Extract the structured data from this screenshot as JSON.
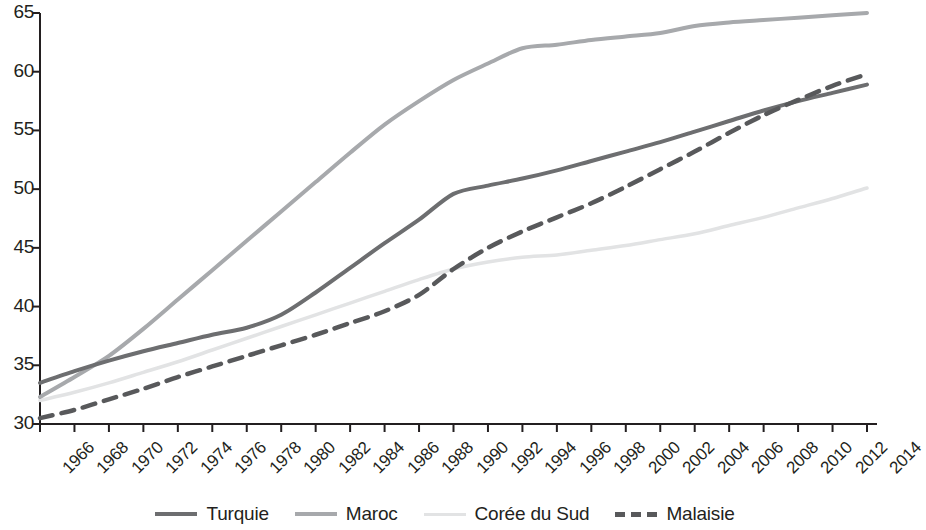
{
  "chart_data": {
    "type": "line",
    "title": "",
    "xlabel": "",
    "ylabel": "",
    "xlim": [
      1966,
      2014
    ],
    "ylim": [
      30,
      65
    ],
    "grid": false,
    "legend_position": "bottom",
    "x_ticks": [
      "1966",
      "1968",
      "1970",
      "1972",
      "1974",
      "1976",
      "1978",
      "1980",
      "1982",
      "1984",
      "1986",
      "1988",
      "1990",
      "1992",
      "1994",
      "1996",
      "1998",
      "2000",
      "2002",
      "2004",
      "2006",
      "2008",
      "2010",
      "2012",
      "2014"
    ],
    "y_ticks": [
      "30",
      "35",
      "40",
      "45",
      "50",
      "55",
      "60",
      "65"
    ],
    "x": [
      1966,
      1968,
      1970,
      1972,
      1974,
      1976,
      1978,
      1980,
      1982,
      1984,
      1986,
      1988,
      1990,
      1992,
      1994,
      1996,
      1998,
      2000,
      2002,
      2004,
      2006,
      2008,
      2010,
      2012,
      2014
    ],
    "series": [
      {
        "name": "Turquie",
        "color": "#6d6e70",
        "style": "solid",
        "width": 4,
        "values": [
          33.5,
          34.5,
          35.4,
          36.2,
          36.9,
          37.6,
          38.2,
          39.3,
          41.2,
          43.3,
          45.4,
          47.4,
          49.6,
          50.3,
          50.9,
          51.6,
          52.4,
          53.2,
          54.0,
          54.9,
          55.8,
          56.7,
          57.5,
          58.2,
          58.9
        ]
      },
      {
        "name": "Maroc",
        "color": "#a7a9ac",
        "style": "solid",
        "width": 4,
        "values": [
          32.3,
          34.0,
          35.8,
          38.1,
          40.6,
          43.1,
          45.6,
          48.1,
          50.6,
          53.1,
          55.5,
          57.5,
          59.3,
          60.7,
          62.0,
          62.3,
          62.7,
          63.0,
          63.3,
          63.9,
          64.2,
          64.4,
          64.6,
          64.8,
          65.0
        ]
      },
      {
        "name": "Corée du Sud",
        "color": "#e2e3e4",
        "style": "solid",
        "width": 3.5,
        "values": [
          32.0,
          32.7,
          33.5,
          34.4,
          35.3,
          36.3,
          37.3,
          38.3,
          39.3,
          40.3,
          41.3,
          42.3,
          43.2,
          43.8,
          44.2,
          44.4,
          44.8,
          45.2,
          45.7,
          46.2,
          46.9,
          47.6,
          48.4,
          49.2,
          50.1
        ]
      },
      {
        "name": "Malaisie",
        "color": "#58595b",
        "style": "dashed",
        "width": 4.5,
        "values": [
          30.5,
          31.2,
          32.1,
          33.0,
          34.0,
          34.9,
          35.8,
          36.7,
          37.6,
          38.6,
          39.6,
          41.0,
          43.2,
          45.0,
          46.4,
          47.6,
          48.8,
          50.2,
          51.7,
          53.2,
          54.8,
          56.3,
          57.6,
          58.8,
          59.8
        ]
      }
    ]
  },
  "legend": {
    "items": [
      {
        "label": "Turquie"
      },
      {
        "label": "Maroc"
      },
      {
        "label": "Corée du Sud"
      },
      {
        "label": "Malaisie"
      }
    ]
  },
  "axis": {
    "color": "#231f20"
  }
}
